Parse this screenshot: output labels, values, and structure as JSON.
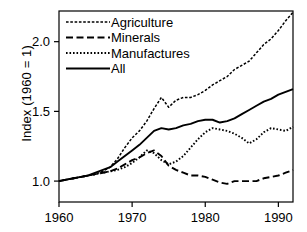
{
  "chart_data": {
    "type": "line",
    "title": "",
    "subtitle": "",
    "xlabel": "",
    "ylabel": "Index (1960 = 1)",
    "xlim": [
      1960,
      1992
    ],
    "ylim": [
      0.85,
      2.22
    ],
    "xticks": [
      1960,
      1970,
      1980,
      1990
    ],
    "xticklabels": [
      "1960",
      "1970",
      "1980",
      "1990"
    ],
    "yticks": [
      1.0,
      1.5,
      2.0
    ],
    "yticklabels": [
      "1.0",
      "1.5",
      "2.0"
    ],
    "grid": false,
    "legend_position": "top-left",
    "frame": "box",
    "series": [
      {
        "name": "Agriculture",
        "style": "dash-dot-fine",
        "color": "#000000",
        "x": [
          1960,
          1961,
          1962,
          1963,
          1964,
          1965,
          1966,
          1967,
          1968,
          1969,
          1970,
          1971,
          1972,
          1973,
          1974,
          1975,
          1976,
          1977,
          1978,
          1979,
          1980,
          1981,
          1982,
          1983,
          1984,
          1985,
          1986,
          1987,
          1988,
          1989,
          1990,
          1991,
          1992
        ],
        "values": [
          1.0,
          1.01,
          1.02,
          1.03,
          1.04,
          1.05,
          1.07,
          1.1,
          1.16,
          1.24,
          1.31,
          1.36,
          1.43,
          1.52,
          1.6,
          1.53,
          1.58,
          1.6,
          1.6,
          1.62,
          1.65,
          1.69,
          1.72,
          1.75,
          1.8,
          1.83,
          1.86,
          1.92,
          1.98,
          2.02,
          2.08,
          2.15,
          2.21
        ]
      },
      {
        "name": "Minerals",
        "style": "long-dash",
        "color": "#000000",
        "x": [
          1960,
          1961,
          1962,
          1963,
          1964,
          1965,
          1966,
          1967,
          1968,
          1969,
          1970,
          1971,
          1972,
          1973,
          1974,
          1975,
          1976,
          1977,
          1978,
          1979,
          1980,
          1981,
          1982,
          1983,
          1984,
          1985,
          1986,
          1987,
          1988,
          1989,
          1990,
          1991,
          1992
        ],
        "values": [
          1.0,
          1.01,
          1.02,
          1.03,
          1.04,
          1.05,
          1.06,
          1.07,
          1.09,
          1.12,
          1.15,
          1.17,
          1.2,
          1.22,
          1.18,
          1.11,
          1.08,
          1.06,
          1.04,
          1.04,
          1.03,
          1.01,
          0.99,
          0.98,
          1.0,
          1.0,
          1.0,
          1.0,
          1.02,
          1.03,
          1.04,
          1.06,
          1.08
        ]
      },
      {
        "name": "Manufactures",
        "style": "dotted",
        "color": "#000000",
        "x": [
          1960,
          1961,
          1962,
          1963,
          1964,
          1965,
          1966,
          1967,
          1968,
          1969,
          1970,
          1971,
          1972,
          1973,
          1974,
          1975,
          1976,
          1977,
          1978,
          1979,
          1980,
          1981,
          1982,
          1983,
          1984,
          1985,
          1986,
          1987,
          1988,
          1989,
          1990,
          1991,
          1992
        ],
        "values": [
          1.0,
          1.01,
          1.02,
          1.03,
          1.04,
          1.05,
          1.06,
          1.07,
          1.08,
          1.1,
          1.13,
          1.17,
          1.22,
          1.2,
          1.15,
          1.12,
          1.14,
          1.18,
          1.24,
          1.3,
          1.35,
          1.38,
          1.37,
          1.36,
          1.34,
          1.31,
          1.27,
          1.3,
          1.35,
          1.38,
          1.37,
          1.36,
          1.39
        ]
      },
      {
        "name": "All",
        "style": "solid",
        "color": "#000000",
        "x": [
          1960,
          1961,
          1962,
          1963,
          1964,
          1965,
          1966,
          1967,
          1968,
          1969,
          1970,
          1971,
          1972,
          1973,
          1974,
          1975,
          1976,
          1977,
          1978,
          1979,
          1980,
          1981,
          1982,
          1983,
          1984,
          1985,
          1986,
          1987,
          1988,
          1989,
          1990,
          1991,
          1992
        ],
        "values": [
          1.0,
          1.01,
          1.02,
          1.03,
          1.04,
          1.06,
          1.08,
          1.1,
          1.14,
          1.18,
          1.22,
          1.26,
          1.31,
          1.36,
          1.38,
          1.37,
          1.38,
          1.4,
          1.41,
          1.43,
          1.44,
          1.44,
          1.42,
          1.43,
          1.45,
          1.48,
          1.51,
          1.54,
          1.57,
          1.59,
          1.62,
          1.64,
          1.66
        ]
      }
    ]
  },
  "legend": {
    "items": [
      {
        "label": "Agriculture"
      },
      {
        "label": "Minerals"
      },
      {
        "label": "Manufactures"
      },
      {
        "label": "All"
      }
    ]
  }
}
